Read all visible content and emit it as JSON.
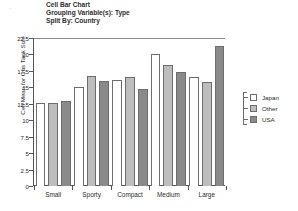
{
  "header": {
    "line1": "Cell Bar Chart",
    "line2": "Grouping Variable(s): Type",
    "line3": "Split By: Country"
  },
  "legend": {
    "items": [
      {
        "label": "Japan",
        "color": "#ffffff"
      },
      {
        "label": "Other",
        "color": "#bdbdbd"
      },
      {
        "label": "USA",
        "color": "#8a8a8a"
      }
    ]
  },
  "chart_data": {
    "type": "bar",
    "title": "Cell Bar Chart",
    "subtitle": "Grouping Variable(s): Type",
    "split_by": "Split By: Country",
    "xlabel": "",
    "ylabel": "Cell Mean for Gas Tank Size",
    "ylim": [
      0,
      22.5
    ],
    "yticks": [
      0,
      2.5,
      5,
      7.5,
      10,
      12.5,
      15,
      17.5,
      20,
      22.5
    ],
    "ytick_labels": [
      "0",
      "2.5",
      "5",
      "7.5",
      "10",
      "12.5",
      "15",
      "17.5",
      "20",
      "22.5"
    ],
    "grid": false,
    "legend_position": "right",
    "categories": [
      "Small",
      "Sporty",
      "Compact",
      "Medium",
      "Large"
    ],
    "series": [
      {
        "name": "Japan",
        "color": "#ffffff",
        "values": [
          12.6,
          15.0,
          16.1,
          20.0,
          16.6
        ]
      },
      {
        "name": "Other",
        "color": "#bdbdbd",
        "values": [
          12.6,
          16.8,
          16.6,
          18.4,
          15.8
        ]
      },
      {
        "name": "USA",
        "color": "#8a8a8a",
        "values": [
          13.0,
          16.0,
          14.8,
          17.3,
          21.3
        ]
      }
    ]
  }
}
